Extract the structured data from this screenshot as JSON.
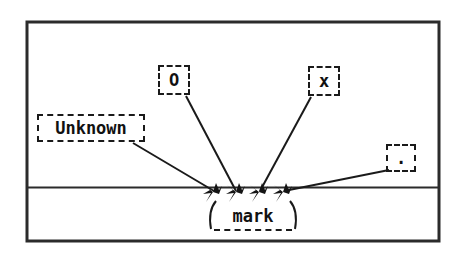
{
  "figure": {
    "type": "annotated-line-diagram",
    "frame": {
      "border_color": "#2b2b2b",
      "background": "#ffffff",
      "x": 26,
      "y": 21,
      "width": 414,
      "height": 221
    },
    "baseline": {
      "name": "horizontal-rule",
      "y": 187,
      "color": "#2b2b2b"
    },
    "ink_color": "#1a1a1a",
    "labels": [
      {
        "id": "unknown",
        "text": "Unknown",
        "box": {
          "x": 37,
          "y": 114,
          "width": 108,
          "height": 28
        },
        "leader": {
          "from_x": 133,
          "from_y": 142,
          "to_x": 214,
          "to_y": 190
        },
        "arrow_index": 0
      },
      {
        "id": "o",
        "text": "O",
        "box": {
          "x": 158,
          "y": 65,
          "width": 32,
          "height": 30
        },
        "leader": {
          "from_x": 185,
          "from_y": 95,
          "to_x": 236,
          "to_y": 190
        },
        "arrow_index": 1
      },
      {
        "id": "x",
        "text": "x",
        "box": {
          "x": 308,
          "y": 66,
          "width": 32,
          "height": 30
        },
        "leader": {
          "from_x": 312,
          "from_y": 96,
          "to_x": 260,
          "to_y": 190
        },
        "arrow_index": 2
      },
      {
        "id": "dot",
        "text": ".",
        "box": {
          "x": 386,
          "y": 144,
          "width": 30,
          "height": 28
        },
        "leader": {
          "from_x": 388,
          "from_y": 170,
          "to_x": 284,
          "to_y": 190
        },
        "arrow_index": 3
      },
      {
        "id": "mark",
        "text": "mark",
        "box": {
          "x": 214,
          "y": 203,
          "width": 78,
          "height": 28
        },
        "leader": null,
        "arrow_index": null
      }
    ],
    "arrows": [
      {
        "name": "arrowhead-unknown",
        "x": 213,
        "y": 190
      },
      {
        "name": "arrowhead-o",
        "x": 236,
        "y": 190
      },
      {
        "name": "arrowhead-x",
        "x": 259,
        "y": 190
      },
      {
        "name": "arrowhead-dot",
        "x": 283,
        "y": 190
      }
    ]
  }
}
